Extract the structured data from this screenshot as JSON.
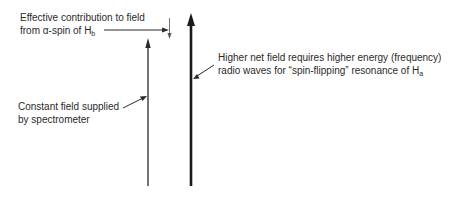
{
  "diagram": {
    "labels": {
      "effective_line1": "Effective contribution to field",
      "effective_line2_prefix": "from α-spin of H",
      "effective_line2_sub": "b",
      "constant_line1": "Constant field supplied",
      "constant_line2": "by spectrometer",
      "higher_line1": "Higher net field requires higher energy (frequency)",
      "higher_line2_prefix": "radio waves for “spin-flipping” resonance of H",
      "higher_line2_sub": "a"
    },
    "arrows": [
      {
        "name": "constant-field-arrow",
        "direction": "up",
        "weight": "thin"
      },
      {
        "name": "net-field-arrow",
        "direction": "up",
        "weight": "thick"
      },
      {
        "name": "contribution-arrow",
        "direction": "down",
        "weight": "thin"
      }
    ],
    "colors": {
      "ink": "#2a2a2a",
      "background": "#ffffff"
    }
  }
}
